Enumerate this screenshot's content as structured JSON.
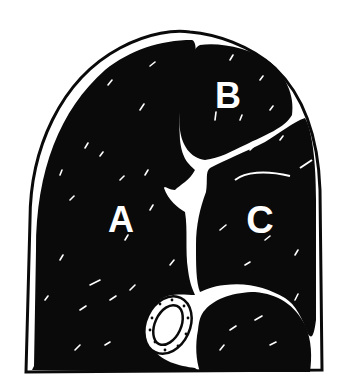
{
  "diagram": {
    "type": "cross-section illustration",
    "colors": {
      "muscle": "#0a0a0a",
      "fat": "#ffffff",
      "outline": "#0a0a0a",
      "background": "#ffffff"
    },
    "regions": [
      {
        "id": "A",
        "label": "A",
        "description": "large left muscle region"
      },
      {
        "id": "B",
        "label": "B",
        "description": "upper right muscle region"
      },
      {
        "id": "C",
        "label": "C",
        "description": "right muscle region"
      }
    ],
    "features": [
      {
        "id": "bone",
        "description": "oval bone cross-section, lower center"
      },
      {
        "id": "fat-seam",
        "description": "white branching fat seams separating regions"
      },
      {
        "id": "lower-muscle",
        "description": "lower right rounded muscle below C"
      }
    ]
  }
}
